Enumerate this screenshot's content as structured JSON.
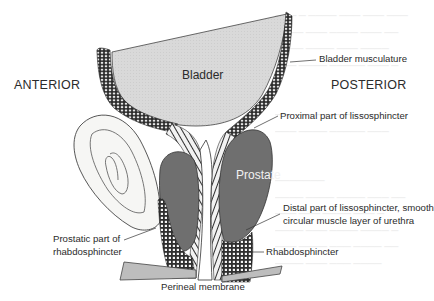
{
  "figure": {
    "type": "anatomical-diagram"
  },
  "orientation": {
    "anterior": "ANTERIOR",
    "posterior": "POSTERIOR"
  },
  "organs": {
    "bladder": "Bladder",
    "prostate": "Prostate"
  },
  "labels": {
    "bladder_musculature": "Bladder musculature",
    "proximal_lissosphincter": "Proximal part of lissosphincter",
    "distal_lissosphincter_line1": "Distal part of lissosphincter, smooth",
    "distal_lissosphincter_line2": "circular muscle layer of urethra",
    "rhabdosphincter": "Rhabdosphincter",
    "prostatic_rhabdo_line1": "Prostatic part of",
    "prostatic_rhabdo_line2": "rhabdosphincter",
    "perineal_membrane": "Perineal membrane"
  },
  "colors": {
    "bladder_fill": "#dcdcdc",
    "prostate_fill": "#7a7a7a",
    "membrane_fill": "#bdbdbd",
    "muscle_dark": "#3a3a3a",
    "line": "#333333",
    "background": "#ffffff"
  }
}
